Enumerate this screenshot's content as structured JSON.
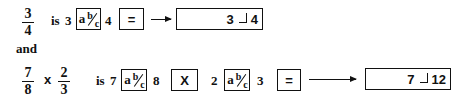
{
  "example1": {
    "fraction": {
      "numerator": "3",
      "denominator": "4"
    },
    "is_label": "is",
    "whole": "3",
    "key_abc": {
      "a": "a",
      "b": "b",
      "c": "c"
    },
    "operand": "4",
    "key_equals": "=",
    "display": {
      "left": "3",
      "right": "4"
    }
  },
  "connector": "and",
  "example2": {
    "fraction1": {
      "numerator": "7",
      "denominator": "8"
    },
    "operator": "x",
    "fraction2": {
      "numerator": "2",
      "denominator": "3"
    },
    "is_label": "is",
    "whole1": "7",
    "key_abc1": {
      "a": "a",
      "b": "b",
      "c": "c"
    },
    "operand1": "8",
    "key_multiply": "X",
    "whole2": "2",
    "key_abc2": {
      "a": "a",
      "b": "b",
      "c": "c"
    },
    "operand2": "3",
    "key_equals": "=",
    "display": {
      "left": "7",
      "right": "12"
    }
  }
}
